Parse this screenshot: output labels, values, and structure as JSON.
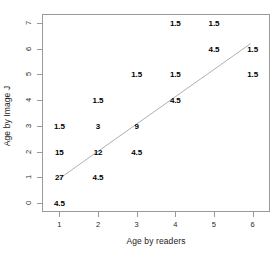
{
  "chart_data": {
    "type": "scatter",
    "title": "",
    "xlabel": "Age by readers",
    "ylabel": "Age by Image J",
    "xlim": [
      0.55,
      6.45
    ],
    "ylim": [
      -0.35,
      7.35
    ],
    "xticks": [
      1,
      2,
      3,
      4,
      5,
      6
    ],
    "xtick_labels": [
      "1",
      "2",
      "3",
      "4",
      "5",
      "6"
    ],
    "yticks": [
      0,
      1,
      2,
      3,
      4,
      5,
      6,
      7
    ],
    "ytick_labels": [
      "0",
      "1",
      "2",
      "3",
      "4",
      "5",
      "6",
      "7"
    ],
    "grid": false,
    "legend": "none",
    "marker_style": "text-count-label",
    "points": [
      {
        "x": 1,
        "y": 0,
        "label": "4.5"
      },
      {
        "x": 1,
        "y": 1,
        "label": "27"
      },
      {
        "x": 2,
        "y": 1,
        "label": "4.5"
      },
      {
        "x": 1,
        "y": 2,
        "label": "15"
      },
      {
        "x": 2,
        "y": 2,
        "label": "12"
      },
      {
        "x": 3,
        "y": 2,
        "label": "4.5"
      },
      {
        "x": 1,
        "y": 3,
        "label": "1.5"
      },
      {
        "x": 2,
        "y": 3,
        "label": "3"
      },
      {
        "x": 3,
        "y": 3,
        "label": "9"
      },
      {
        "x": 2,
        "y": 4,
        "label": "1.5"
      },
      {
        "x": 4,
        "y": 4,
        "label": "4.5"
      },
      {
        "x": 3,
        "y": 5,
        "label": "1.5"
      },
      {
        "x": 4,
        "y": 5,
        "label": "1.5"
      },
      {
        "x": 6,
        "y": 5,
        "label": "1.5"
      },
      {
        "x": 5,
        "y": 6,
        "label": "4.5"
      },
      {
        "x": 6,
        "y": 6,
        "label": "1.5"
      },
      {
        "x": 4,
        "y": 7,
        "label": "1.5"
      },
      {
        "x": 5,
        "y": 7,
        "label": "1.5"
      }
    ],
    "trendline": {
      "type": "line",
      "x_start": 1.0,
      "y_start": 0.95,
      "x_end": 5.95,
      "y_end": 6.2,
      "color": "#b0b0b0"
    },
    "colors": {
      "axis": "#9a9a9a",
      "text": "#1a1a1a",
      "trendline": "#b0b0b0",
      "background": "#ffffff"
    }
  }
}
